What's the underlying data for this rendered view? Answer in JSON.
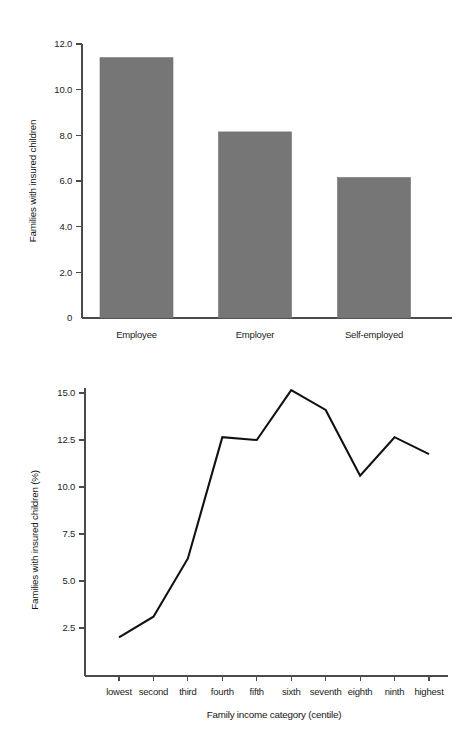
{
  "chart_data": [
    {
      "type": "bar",
      "id": "employment-status-bar-chart",
      "title": "",
      "xlabel": "",
      "ylabel": "Families with insured children",
      "categories": [
        "Employee",
        "Employer",
        "Self-employed"
      ],
      "values": [
        11.4,
        8.15,
        6.15
      ],
      "ytick_labels": [
        "0",
        "2.0",
        "4.0",
        "6.0",
        "8.0",
        "10.0",
        "12.0"
      ],
      "yticks": [
        0,
        2,
        4,
        6,
        8,
        10,
        12
      ],
      "ylim": [
        0,
        12
      ],
      "grid": false,
      "legend": "none",
      "bar_color": "#767676"
    },
    {
      "type": "line",
      "id": "income-centile-line-chart",
      "title": "",
      "xlabel": "Family income category (centile)",
      "ylabel": "Families with insured children (%)",
      "categories": [
        "lowest",
        "second",
        "third",
        "fourth",
        "fifth",
        "sixth",
        "seventh",
        "eighth",
        "ninth",
        "highest"
      ],
      "values": [
        2.0,
        3.1,
        6.2,
        12.65,
        12.5,
        15.15,
        14.1,
        10.6,
        12.65,
        11.75
      ],
      "ytick_labels": [
        "2.5",
        "5.0",
        "7.5",
        "10.0",
        "12.5",
        "15.0"
      ],
      "yticks": [
        2.5,
        5.0,
        7.5,
        10.0,
        12.5,
        15.0
      ],
      "ylim": [
        0,
        15.6
      ],
      "grid": false,
      "legend": "none",
      "line_color": "#111111"
    }
  ]
}
